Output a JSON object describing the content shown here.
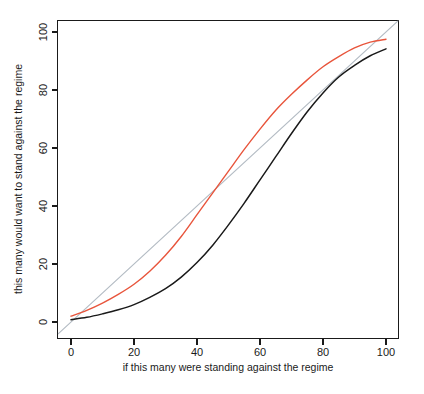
{
  "chart_data": {
    "type": "line",
    "title": "",
    "subtitle": "",
    "xlabel": "if this many were standing against the regime",
    "ylabel": "this many would want to stand against the regime",
    "xlim": [
      0,
      100
    ],
    "ylim": [
      0,
      100
    ],
    "xticks": [
      0,
      20,
      40,
      60,
      80,
      100
    ],
    "yticks": [
      0,
      20,
      40,
      60,
      80,
      100
    ],
    "xtick_labels": [
      "0",
      "20",
      "40",
      "60",
      "80",
      "100"
    ],
    "ytick_labels": [
      "0",
      "20",
      "40",
      "60",
      "80",
      "100"
    ],
    "grid": false,
    "legend": "none",
    "background": "#ffffff",
    "axis_color": "#1a1a1a",
    "box": true,
    "series": [
      {
        "name": "identity-reference-line",
        "color": "#b4bcc4",
        "width": 1.2,
        "style": "solid",
        "x": [
          -4,
          104
        ],
        "values": [
          -4,
          104
        ]
      },
      {
        "name": "red-threshold-curve",
        "color": "#e8553c",
        "width": 1.4,
        "style": "solid",
        "x": [
          0,
          5,
          10,
          15,
          20,
          25,
          30,
          35,
          40,
          45,
          50,
          55,
          60,
          65,
          70,
          75,
          80,
          85,
          90,
          95,
          100
        ],
        "values": [
          2.0,
          4.0,
          6.5,
          9.5,
          13.0,
          17.5,
          23.0,
          29.5,
          37.0,
          44.5,
          52.0,
          59.5,
          66.5,
          73.0,
          78.5,
          83.5,
          88.0,
          91.5,
          94.5,
          96.5,
          97.5
        ]
      },
      {
        "name": "black-threshold-curve",
        "color": "#1a1a1a",
        "width": 1.5,
        "style": "solid",
        "x": [
          0,
          5,
          10,
          15,
          20,
          25,
          30,
          35,
          40,
          45,
          50,
          55,
          60,
          65,
          70,
          75,
          80,
          85,
          90,
          95,
          100
        ],
        "values": [
          0.8,
          1.6,
          2.8,
          4.2,
          6.0,
          8.5,
          11.5,
          15.5,
          20.5,
          26.5,
          33.5,
          41.0,
          49.0,
          57.0,
          65.0,
          72.5,
          79.0,
          84.5,
          88.5,
          91.8,
          94.2
        ]
      }
    ]
  }
}
